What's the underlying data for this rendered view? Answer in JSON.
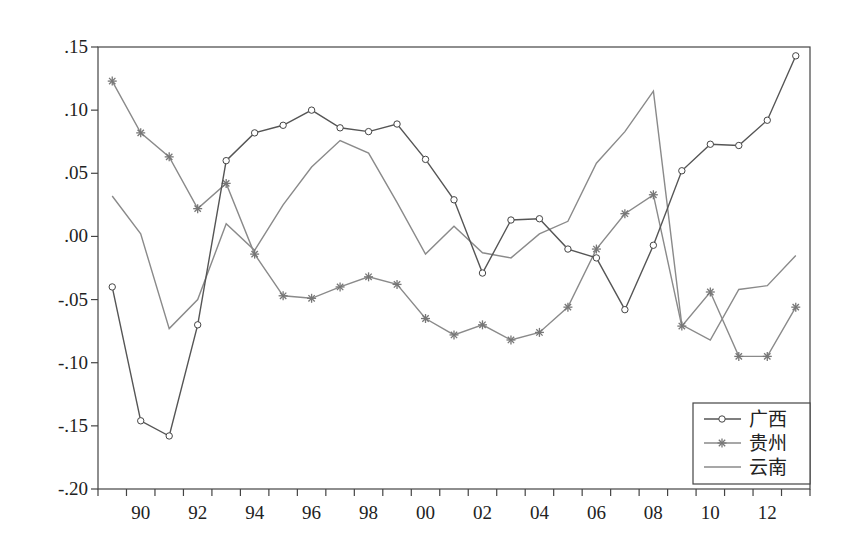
{
  "chart_data": {
    "type": "line",
    "title": "",
    "xlabel": "",
    "ylabel": "",
    "x": [
      "89",
      "90",
      "91",
      "92",
      "93",
      "94",
      "95",
      "96",
      "97",
      "98",
      "99",
      "00",
      "01",
      "02",
      "03",
      "04",
      "05",
      "06",
      "07",
      "08",
      "09",
      "10",
      "11",
      "12",
      "13"
    ],
    "x_years": [
      1989,
      1990,
      1991,
      1992,
      1993,
      1994,
      1995,
      1996,
      1997,
      1998,
      1999,
      2000,
      2001,
      2002,
      2003,
      2004,
      2005,
      2006,
      2007,
      2008,
      2009,
      2010,
      2011,
      2012,
      2013
    ],
    "x_tick_labels": [
      "90",
      "92",
      "94",
      "96",
      "98",
      "00",
      "02",
      "04",
      "06",
      "08",
      "10",
      "12"
    ],
    "y_tick_labels": [
      ".15",
      ".10",
      ".05",
      ".00",
      "-.05",
      "-.10",
      "-.15",
      "-.20"
    ],
    "y_ticks": [
      0.15,
      0.1,
      0.05,
      0.0,
      -0.05,
      -0.1,
      -0.15,
      -0.2
    ],
    "ylim": [
      -0.2,
      0.15
    ],
    "grid": false,
    "legend_position": "lower right",
    "series": [
      {
        "name": "广西",
        "marker": "circle",
        "color": "#555555",
        "values": [
          -0.04,
          -0.146,
          -0.158,
          -0.07,
          0.06,
          0.082,
          0.088,
          0.1,
          0.086,
          0.083,
          0.089,
          0.061,
          0.029,
          -0.029,
          0.013,
          0.014,
          -0.01,
          -0.017,
          -0.058,
          -0.007,
          0.052,
          0.073,
          0.072,
          0.092,
          0.143
        ]
      },
      {
        "name": "贵州",
        "marker": "star",
        "color": "#888888",
        "values": [
          0.123,
          0.082,
          0.063,
          0.022,
          0.042,
          -0.014,
          -0.047,
          -0.049,
          -0.04,
          -0.032,
          -0.038,
          -0.065,
          -0.078,
          -0.07,
          -0.082,
          -0.076,
          -0.056,
          -0.01,
          0.018,
          0.033,
          -0.071,
          -0.044,
          -0.095,
          -0.095,
          -0.056
        ]
      },
      {
        "name": "云南",
        "marker": "none",
        "color": "#888888",
        "values": [
          0.032,
          0.002,
          -0.073,
          -0.05,
          0.01,
          -0.011,
          0.025,
          0.055,
          0.076,
          0.066,
          0.027,
          -0.014,
          0.008,
          -0.013,
          -0.017,
          0.002,
          0.012,
          0.058,
          0.083,
          0.115,
          -0.07,
          -0.082,
          -0.042,
          -0.039,
          -0.015
        ]
      }
    ]
  },
  "legend": {
    "items": [
      {
        "label": "广西",
        "marker": "circle"
      },
      {
        "label": "贵州",
        "marker": "star"
      },
      {
        "label": "云南",
        "marker": "none"
      }
    ]
  }
}
